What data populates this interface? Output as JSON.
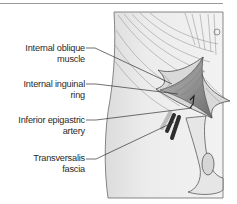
{
  "figure": {
    "type": "anatomical-illustration",
    "colors": {
      "skin_fill": "#ececec",
      "shadow_fill": "#d8d8d8",
      "outline": "#5a5a5a",
      "leader_line": "#333333",
      "vessel_dark": "#2e2e2e",
      "rule": "#9a9a9a"
    }
  },
  "labels": [
    {
      "id": "internal-oblique",
      "line1": "Internal oblique",
      "line2": "muscle"
    },
    {
      "id": "internal-inguinal-ring",
      "line1": "Internal inguinal",
      "line2": "ring"
    },
    {
      "id": "inferior-epigastric-artery",
      "line1": "Inferior epigastric",
      "line2": "artery"
    },
    {
      "id": "transversalis-fascia",
      "line1": "Transversalis",
      "line2": "fascia"
    }
  ]
}
